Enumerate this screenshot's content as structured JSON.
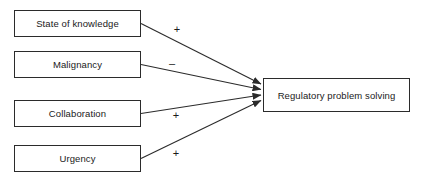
{
  "diagram": {
    "type": "path-diagram",
    "colors": {
      "stroke": "#2b2b2b",
      "text": "#1a1a1a",
      "background": "#ffffff"
    },
    "predictors": [
      {
        "id": "state-of-knowledge",
        "label": "State of knowledge",
        "sign": "+",
        "box": {
          "x": 14,
          "y": 10,
          "w": 127,
          "h": 27
        }
      },
      {
        "id": "malignancy",
        "label": "Malignancy",
        "sign": "–",
        "box": {
          "x": 14,
          "y": 51,
          "w": 127,
          "h": 27
        }
      },
      {
        "id": "collaboration",
        "label": "Collaboration",
        "sign": "+",
        "box": {
          "x": 14,
          "y": 100,
          "w": 127,
          "h": 27
        }
      },
      {
        "id": "urgency",
        "label": "Urgency",
        "sign": "+",
        "box": {
          "x": 14,
          "y": 145,
          "w": 127,
          "h": 27
        }
      }
    ],
    "outcome": {
      "id": "regulatory-problem-solving",
      "label": "Regulatory problem solving",
      "box": {
        "x": 263,
        "y": 78,
        "w": 147,
        "h": 34
      }
    },
    "arrows": [
      {
        "from": "state-of-knowledge",
        "to": "regulatory-problem-solving",
        "sign": "+"
      },
      {
        "from": "malignancy",
        "to": "regulatory-problem-solving",
        "sign": "–"
      },
      {
        "from": "collaboration",
        "to": "regulatory-problem-solving",
        "sign": "+"
      },
      {
        "from": "urgency",
        "to": "regulatory-problem-solving",
        "sign": "+"
      }
    ],
    "sign_positions": [
      {
        "id": "sign-state-of-knowledge",
        "x": 170,
        "y": 24
      },
      {
        "id": "sign-malignancy",
        "x": 165,
        "y": 58
      },
      {
        "id": "sign-collaboration",
        "x": 169,
        "y": 110
      },
      {
        "id": "sign-urgency",
        "x": 169,
        "y": 148
      }
    ]
  }
}
